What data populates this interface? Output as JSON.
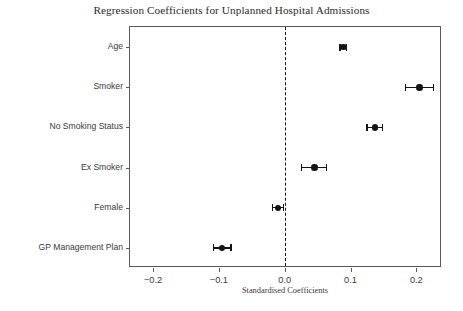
{
  "chart_data": {
    "type": "scatter",
    "title": "Regression Coefficients for Unplanned Hospital Admissions",
    "xlabel": "Standardised Coefficients",
    "ylabel": "",
    "xlim": [
      -0.235,
      0.239
    ],
    "xticks": [
      -0.2,
      -0.1,
      0.0,
      0.1,
      0.2
    ],
    "xtick_labels": [
      "−0.2",
      "−0.1",
      "0.0",
      "0.1",
      "0.2"
    ],
    "categories": [
      "Age",
      "Smoker",
      "No Smoking Status",
      "Ex Smoker",
      "Female",
      "GP Management Plan"
    ],
    "values": [
      0.089,
      0.205,
      0.137,
      0.045,
      -0.01,
      -0.095
    ],
    "errors": [
      0.005,
      0.021,
      0.012,
      0.019,
      0.008,
      0.0135
    ],
    "reference_line": 0.0,
    "reference_line_style": "dashed",
    "grid": false,
    "legend": "none",
    "marker": "circle",
    "marker_color": "#141414",
    "errorbar_color": "#141414",
    "reference_line_color": "#111111",
    "frame_color": "#5a5a5a",
    "background_color": "#ffffff"
  }
}
